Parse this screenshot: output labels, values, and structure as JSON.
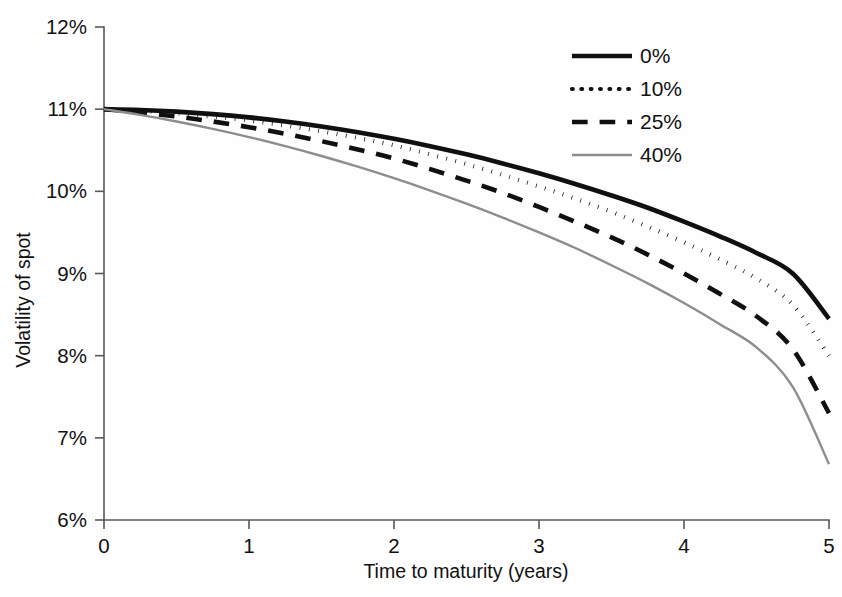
{
  "chart_data": {
    "type": "line",
    "title": "",
    "xlabel": "Time to maturity (years)",
    "ylabel": "Volatility of spot",
    "xlim": [
      0,
      5
    ],
    "ylim": [
      6,
      12
    ],
    "grid": false,
    "legend_position": "top-right",
    "x_ticks": [
      "0",
      "1",
      "2",
      "3",
      "4",
      "5"
    ],
    "x_tick_values": [
      0,
      1,
      2,
      3,
      4,
      5
    ],
    "y_ticks": [
      "6%",
      "7%",
      "8%",
      "9%",
      "10%",
      "11%",
      "12%"
    ],
    "y_tick_values": [
      6,
      7,
      8,
      9,
      10,
      11,
      12
    ],
    "x": [
      0,
      0.25,
      0.5,
      0.75,
      1,
      1.25,
      1.5,
      1.75,
      2,
      2.25,
      2.5,
      2.75,
      3,
      3.25,
      3.5,
      3.75,
      4,
      4.25,
      4.5,
      4.75,
      5
    ],
    "series": [
      {
        "name": "0%",
        "style": "solid",
        "color": "#101010",
        "width": 4.6,
        "values": [
          11.0,
          10.99,
          10.97,
          10.94,
          10.9,
          10.85,
          10.79,
          10.72,
          10.64,
          10.55,
          10.45,
          10.34,
          10.22,
          10.09,
          9.95,
          9.8,
          9.63,
          9.45,
          9.25,
          9.0,
          8.45
        ]
      },
      {
        "name": "10%",
        "style": "dotted",
        "color": "#101010",
        "width": 4.2,
        "values": [
          11.0,
          10.98,
          10.95,
          10.91,
          10.86,
          10.8,
          10.73,
          10.65,
          10.56,
          10.45,
          10.33,
          10.2,
          10.06,
          9.91,
          9.75,
          9.57,
          9.38,
          9.17,
          8.94,
          8.62,
          8.0
        ]
      },
      {
        "name": "25%",
        "style": "dashed",
        "color": "#101010",
        "width": 4.6,
        "values": [
          11.0,
          10.96,
          10.91,
          10.85,
          10.78,
          10.7,
          10.61,
          10.51,
          10.4,
          10.27,
          10.13,
          9.98,
          9.81,
          9.63,
          9.44,
          9.23,
          9.0,
          8.75,
          8.48,
          8.08,
          7.3
        ]
      },
      {
        "name": "40%",
        "style": "solid",
        "color": "#8d8d8f",
        "width": 2.4,
        "values": [
          11.0,
          10.93,
          10.85,
          10.76,
          10.66,
          10.55,
          10.43,
          10.3,
          10.16,
          10.01,
          9.85,
          9.68,
          9.5,
          9.31,
          9.1,
          8.88,
          8.64,
          8.38,
          8.1,
          7.62,
          6.68
        ]
      }
    ]
  },
  "legend": {
    "items": [
      {
        "label": "0%"
      },
      {
        "label": "10%"
      },
      {
        "label": "25%"
      },
      {
        "label": "40%"
      }
    ]
  }
}
